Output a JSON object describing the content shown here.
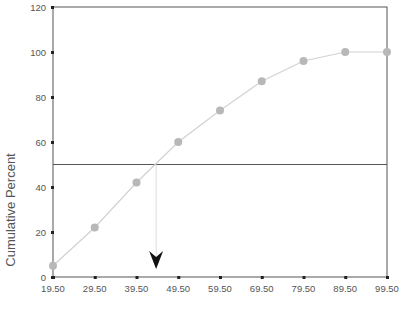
{
  "chart_data": {
    "type": "line",
    "title": "",
    "xlabel": "",
    "ylabel": "Cumulative Percent",
    "x": [
      "19.50",
      "29.50",
      "39.50",
      "49.50",
      "59.50",
      "69.50",
      "79.50",
      "89.50",
      "99.50"
    ],
    "x_values": [
      19.5,
      29.5,
      39.5,
      49.5,
      59.5,
      69.5,
      79.5,
      89.5,
      99.5
    ],
    "series": [
      {
        "name": "Cumulative Percent",
        "values": [
          5,
          22,
          42,
          60,
          74,
          87,
          96,
          100,
          100
        ]
      }
    ],
    "xlim": [
      19.5,
      99.5
    ],
    "ylim": [
      0,
      120
    ],
    "yticks": [
      0,
      20,
      40,
      60,
      80,
      100,
      120
    ],
    "reference_line": {
      "orientation": "horizontal",
      "y": 50
    },
    "dropline": {
      "x": 44.2,
      "from_y": 50,
      "arrow": "down"
    },
    "grid": false,
    "legend": null
  },
  "labels": {
    "ylabel": "Cumulative Percent",
    "yticks": [
      "0",
      "20",
      "40",
      "60",
      "80",
      "100",
      "120"
    ],
    "xticks": [
      "19.50",
      "29.50",
      "39.50",
      "49.50",
      "59.50",
      "69.50",
      "79.50",
      "89.50",
      "99.50"
    ]
  },
  "colors": {
    "axis": "#555555",
    "line": "#d2d2d2",
    "marker": "#b8b8b8",
    "reference": "#555555",
    "dropline": "#dddddd",
    "arrow": "#111111"
  }
}
